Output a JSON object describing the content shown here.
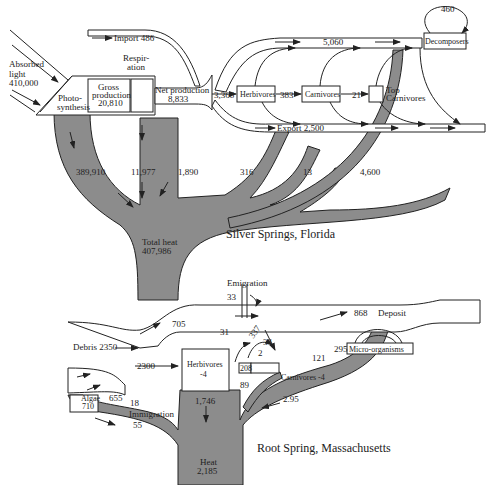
{
  "diagram_a": {
    "caption": "Silver Springs, Florida",
    "inputs": {
      "absorbed_light": [
        "Absorbed",
        "light",
        "410,000"
      ],
      "import": "Import 486"
    },
    "compartments": {
      "photosynthesis": [
        "Photo-",
        "synthesis"
      ],
      "gross_production": [
        "Gross",
        "production",
        "20,810"
      ],
      "respiration": [
        "Respir-",
        "ation"
      ],
      "net_production": [
        "Net production",
        "8,833"
      ],
      "herbivores": "Herbivores",
      "carnivores": "Carnivores",
      "top_carnivores": [
        "Top",
        "Carnivores"
      ],
      "decomposers": "Decomposers"
    },
    "flows": {
      "to_herbivores": "3,368",
      "herb_to_carn": "383",
      "carn_to_top": "21",
      "to_decomposers": "5,060",
      "decomposer_loop": "460",
      "export": "Export 2,500",
      "heat_photosynthesis": "389,910",
      "heat_respiration": "11,977",
      "heat_herbivores": "1,890",
      "heat_carnivores": "316",
      "heat_top": "13",
      "heat_decomposers": "4,600"
    },
    "total_heat": [
      "Total heat",
      "407,986"
    ]
  },
  "diagram_b": {
    "caption": "Root Spring, Massachusetts",
    "compartments": {
      "algae": [
        "Algae",
        "710"
      ],
      "herbivores": [
        "Herbivores",
        "-4"
      ],
      "carnivores": "Carnivores -4",
      "micro_organisms": "Micro-organisms"
    },
    "flows": {
      "emigration": "Emigration",
      "emigration_value": "33",
      "debris": "Debris 2350",
      "to_deposit_705": "705",
      "deposit_value": "868",
      "deposit": "Deposit",
      "to_herbivores": "2300",
      "algae_out": "655",
      "immigration_value": "18",
      "immigration": "Immigration",
      "val_31": "31",
      "val_337": "337",
      "val_34": "34",
      "val_2": "2",
      "val_121": "121",
      "val_295": "295",
      "val_208": "208",
      "val_89": "89",
      "val_295_heat": "2.95",
      "val_55": "55",
      "heat_herbivores": "1,746"
    },
    "heat": [
      "Heat",
      "2,185"
    ]
  }
}
